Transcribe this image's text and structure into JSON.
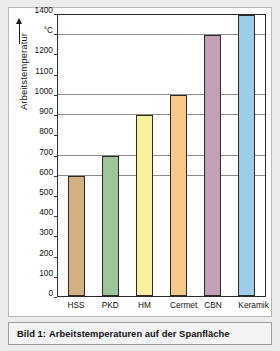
{
  "chart_data": {
    "type": "bar",
    "title": "",
    "categories": [
      "HSS",
      "PKD",
      "HM",
      "Cermet",
      "CBN",
      "Keramik"
    ],
    "values": [
      600,
      700,
      900,
      1000,
      1300,
      1400
    ],
    "series": [
      {
        "name": "Arbeitstemperatur",
        "values": [
          600,
          700,
          900,
          1000,
          1300,
          1400
        ]
      }
    ],
    "xlabel": "",
    "ylabel": "Arbeitstemperatur",
    "yunit": "°C",
    "ylim": [
      0,
      1400
    ],
    "ytick_step": 100,
    "ytick_labels": [
      "1400",
      "°C",
      "1200",
      "1100",
      "1000",
      "900",
      "800",
      "700",
      "600",
      "500",
      "400",
      "300",
      "200",
      "100",
      "0"
    ],
    "ytick_values": [
      1400,
      1300,
      1200,
      1100,
      1000,
      900,
      800,
      700,
      600,
      500,
      400,
      300,
      200,
      100,
      0
    ],
    "gridlines": [
      600,
      700,
      900,
      1000,
      1300,
      1400
    ],
    "grid": true,
    "legend": "none",
    "bar_colors": [
      "#d4b184",
      "#9fc49a",
      "#f7f0a0",
      "#f5c98a",
      "#c4a0b8",
      "#9ecdec"
    ]
  },
  "axis": {
    "y_title": "Arbeitstemperatur"
  },
  "caption": {
    "label": "Bild 1:",
    "text": "Arbeitstemperaturen auf der Spanfläche"
  }
}
